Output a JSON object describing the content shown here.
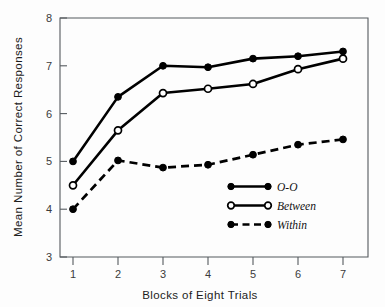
{
  "chart_data": {
    "type": "line",
    "title": "",
    "xlabel": "Blocks of Eight Trials",
    "ylabel": "Mean Number of Correct Responses",
    "x": [
      1,
      2,
      3,
      4,
      5,
      6,
      7
    ],
    "xticklabels": [
      "1",
      "2",
      "3",
      "4",
      "5",
      "6",
      "7"
    ],
    "yticklabels": [
      "3",
      "4",
      "5",
      "6",
      "7",
      "8"
    ],
    "yticks": [
      3,
      4,
      5,
      6,
      7,
      8
    ],
    "xlim": [
      0.6,
      7.45
    ],
    "ylim": [
      3,
      8
    ],
    "grid": false,
    "legend_position": "lower right",
    "series": [
      {
        "name": "O-O",
        "values": [
          5.0,
          6.35,
          7.0,
          6.97,
          7.15,
          7.2,
          7.3
        ],
        "marker": "filled-circle",
        "linestyle": "solid",
        "color": "#000000"
      },
      {
        "name": "Between",
        "values": [
          4.5,
          5.65,
          6.43,
          6.52,
          6.62,
          6.93,
          7.15
        ],
        "marker": "open-circle",
        "linestyle": "solid",
        "color": "#000000"
      },
      {
        "name": "Within",
        "values": [
          4.0,
          5.02,
          4.87,
          4.93,
          5.14,
          5.35,
          5.46
        ],
        "marker": "filled-circle",
        "linestyle": "dashed",
        "color": "#000000"
      }
    ],
    "legend": [
      {
        "label": "O-O",
        "marker": "filled-circle",
        "linestyle": "solid"
      },
      {
        "label": "Between",
        "marker": "open-circle",
        "linestyle": "solid"
      },
      {
        "label": "Within",
        "marker": "filled-circle",
        "linestyle": "dashed"
      }
    ]
  },
  "figure": {
    "background": "#fdfdfd",
    "ink": "#000000",
    "axis_color": "#555a5e"
  }
}
